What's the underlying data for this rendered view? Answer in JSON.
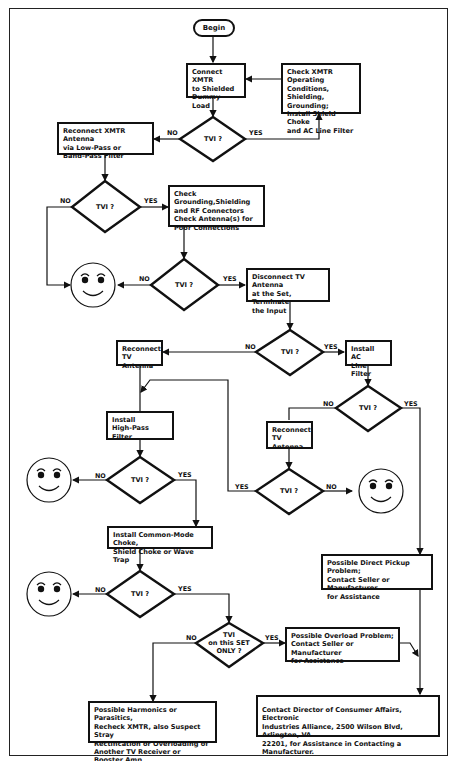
{
  "start": {
    "label": "Begin"
  },
  "boxes": {
    "connect_dummy": "Connect XMTR\nto Shielded\nDummy Load",
    "check_xmtr": "Check XMTR\nOperating Conditions,\nShielding, Grounding;\nInstall Shield Choke\nand AC Line Filter",
    "reconnect_xmtr_ant": "Reconnect XMTR Antenna\nvia Low-Pass or\nBand-Pass Filter",
    "check_grounding": "Check Grounding,Shielding\nand RF Connectors\nCheck Antenna(s) for\nPoor Connections",
    "disconnect_tv_ant": "Disconnect TV Antenna\nat the Set, Terminate\nthe Input",
    "reconnect_tv_ant_1": "Reconnect\nTV Antenna",
    "install_ac": "Install AC\nLine Filter",
    "install_hpf": "Install\nHigh-Pass Filter",
    "reconnect_tv_ant_2": "Reconnect\nTV Antenna",
    "common_mode": "Install Common-Mode Choke,\nShield Choke or Wave Trap",
    "direct_pickup": "Possible Direct Pickup Problem;\nContact Seller or Manufacturer\nfor Assistance",
    "overload": "Possible Overload Problem;\nContact Seller or Manufacturer\nfor Assistance",
    "harmonics": "Possible Harmonics or Parasitics,\nRecheck XMTR, also Suspect Stray\nRectification or Overloading of\nAnother TV Receiver or Booster Amp",
    "contact_director": "Contact Director of Consumer Affairs, Electronic\nIndustries Alliance, 2500 Wilson Blvd, Arlington, VA\n22201, for Assistance in Contacting a Manufacturer."
  },
  "decisions": {
    "tvi": "TVI ?",
    "tvi_set_only": "TVI\non this SET\nONLY ?"
  },
  "edge_labels": {
    "yes": "YES",
    "no": "NO"
  },
  "outcome_icon": "smiley-face-icon"
}
